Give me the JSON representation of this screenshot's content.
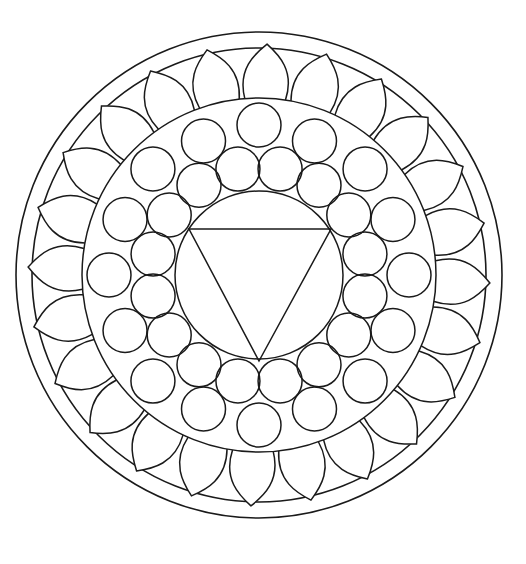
{
  "mandala": {
    "stroke_color": "#1a1a1a",
    "background_color": "#ffffff",
    "center": [
      259,
      275
    ],
    "outer_rings": [
      243,
      227
    ],
    "inner_ring_radius": 177,
    "petals": {
      "count": 24,
      "base_radius": 177,
      "tip_radius": 231,
      "half_width_deg": 6.6,
      "angle_offset_deg": -88
    },
    "circles_band": {
      "circle_radius": 22,
      "isolated": {
        "count": 8,
        "ring_radius": 150,
        "angle_offset_deg": 0
      },
      "trefoil_tips": {
        "count": 8,
        "ring_radius": 145,
        "angle_offset_deg": 22.5
      },
      "inner_ring": {
        "count": 16,
        "ring_radius": 108,
        "angle_offset_deg": 11.25
      }
    },
    "center_circle_radius": 84,
    "triangle": {
      "points": [
        [
          189,
          229
        ],
        [
          331,
          229
        ],
        [
          259,
          361
        ]
      ],
      "orientation": "pointing-down"
    }
  }
}
